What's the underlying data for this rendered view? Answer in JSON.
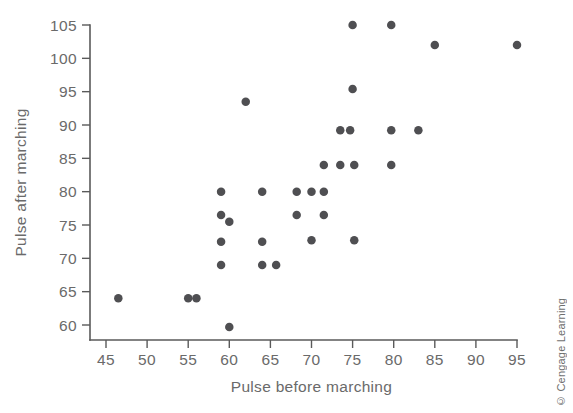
{
  "chart_data": {
    "type": "scatter",
    "title": "",
    "xlabel": "Pulse before marching",
    "ylabel": "Pulse after marching",
    "xlim": [
      43,
      96
    ],
    "ylim": [
      57.5,
      106.5
    ],
    "grid": false,
    "legend": false,
    "xticks": [
      45,
      50,
      55,
      60,
      65,
      70,
      75,
      80,
      85,
      90,
      95
    ],
    "yticks": [
      60,
      65,
      70,
      75,
      80,
      85,
      90,
      95,
      100,
      105
    ],
    "xtick_labels": [
      "45",
      "50",
      "55",
      "60",
      "65",
      "70",
      "75",
      "80",
      "85",
      "90",
      "95"
    ],
    "ytick_labels": [
      "60",
      "65",
      "70",
      "75",
      "80",
      "85",
      "90",
      "95",
      "100",
      "105"
    ],
    "marker": "filled-circle",
    "marker_color": "#4f4f52",
    "marker_size": 7.5,
    "points": [
      {
        "x": 46.5,
        "y": 64
      },
      {
        "x": 55,
        "y": 64
      },
      {
        "x": 56,
        "y": 64
      },
      {
        "x": 59,
        "y": 80
      },
      {
        "x": 59,
        "y": 76.5
      },
      {
        "x": 59,
        "y": 72.5
      },
      {
        "x": 59,
        "y": 69
      },
      {
        "x": 60,
        "y": 75.5
      },
      {
        "x": 60,
        "y": 59.7
      },
      {
        "x": 62,
        "y": 93.5
      },
      {
        "x": 64,
        "y": 80
      },
      {
        "x": 64,
        "y": 72.5
      },
      {
        "x": 64,
        "y": 69
      },
      {
        "x": 65.7,
        "y": 69
      },
      {
        "x": 68.2,
        "y": 80
      },
      {
        "x": 68.2,
        "y": 76.5
      },
      {
        "x": 70,
        "y": 80
      },
      {
        "x": 70,
        "y": 72.7
      },
      {
        "x": 71.5,
        "y": 84
      },
      {
        "x": 71.5,
        "y": 80
      },
      {
        "x": 71.5,
        "y": 76.5
      },
      {
        "x": 73.5,
        "y": 89.2
      },
      {
        "x": 73.5,
        "y": 84
      },
      {
        "x": 74.7,
        "y": 89.2
      },
      {
        "x": 75,
        "y": 105
      },
      {
        "x": 75,
        "y": 95.4
      },
      {
        "x": 75.2,
        "y": 84
      },
      {
        "x": 75.2,
        "y": 72.7
      },
      {
        "x": 79.7,
        "y": 105
      },
      {
        "x": 79.7,
        "y": 89.2
      },
      {
        "x": 79.7,
        "y": 84
      },
      {
        "x": 83,
        "y": 89.2
      },
      {
        "x": 85,
        "y": 102
      },
      {
        "x": 95,
        "y": 102
      }
    ]
  },
  "credit": {
    "text": "© Cengage Learning"
  },
  "colors": {
    "axis": "#5a5a5a",
    "tick_text": "#6a6a6a",
    "marker": "#4f4f52",
    "background": "#ffffff"
  }
}
